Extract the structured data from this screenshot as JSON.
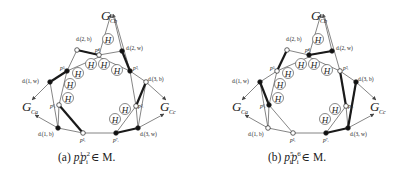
{
  "figure": {
    "panels": [
      {
        "id": "a",
        "caption": {
          "prefix": "(a) ",
          "p1": "p",
          "p1_sup": "1",
          "p1_sub": "i",
          "p2": "p",
          "p2_sup": "2",
          "p2_sub": "i",
          "suffix": " ∈ M."
        },
        "matched_edge": "p_i^1 p_i^2"
      },
      {
        "id": "b",
        "caption": {
          "prefix": "(b) ",
          "p1": "p",
          "p1_sup": "5",
          "p1_sub": "i",
          "p2": "p",
          "p2_sup": "6",
          "p2_sub": "i",
          "suffix": " ∈ M."
        },
        "matched_edge": "p_i^5 p_i^6"
      }
    ],
    "labels": {
      "G_Cb": "G",
      "G_Cb_sub": "Cb",
      "G_Ca": "G",
      "G_Ca_sub": "Ca",
      "G_Cc": "G",
      "G_Cc_sub": "Cc",
      "d_2b": "dᵢ(2, b)",
      "d_2w": "dᵢ(2, w)",
      "d_1w": "dᵢ(1, w)",
      "d_3b": "dᵢ(3, b)",
      "d_1b": "dᵢ(1, b)",
      "d_3w": "dᵢ(3, w)",
      "p1": "p¹ᵢ",
      "p2": "p²ᵢ",
      "p3": "p³ᵢ",
      "p4": "p⁴ᵢ",
      "p5": "p⁵ᵢ",
      "p6": "p⁶ᵢ",
      "p7": "p⁷ᵢ",
      "H": "H"
    },
    "colors": {
      "line": "#555555",
      "bold_line": "#1a1a1a",
      "black_vertex": "#111111",
      "white_vertex": "#ffffff"
    }
  }
}
